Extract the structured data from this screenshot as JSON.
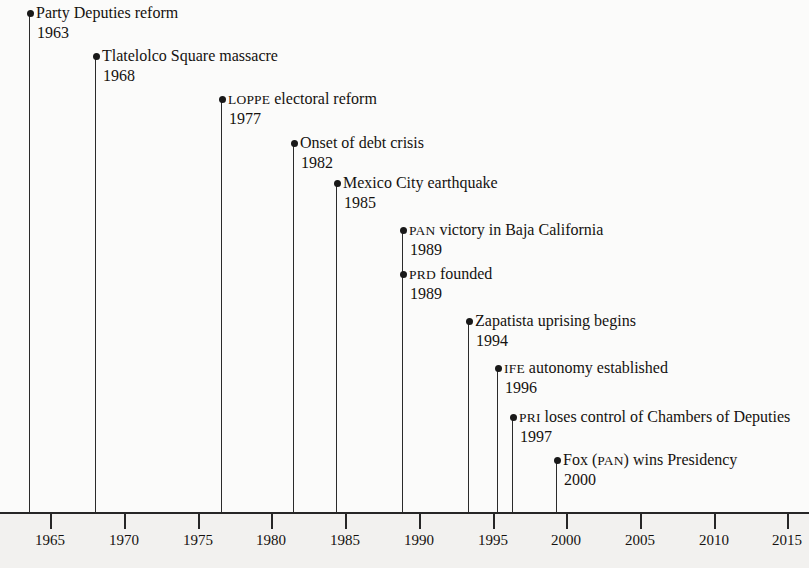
{
  "figure": {
    "background_color": "#fbfbfa",
    "axis_band_color": "#f2f1ef",
    "line_color": "#2b2b2b",
    "text_color": "#15120f"
  },
  "chart_data": {
    "type": "timeline",
    "title": "",
    "subtitle": "",
    "xlabel": "",
    "ylabel": "",
    "xlim": [
      1961.5,
      2017.5
    ],
    "grid": false,
    "legend": null,
    "axis": {
      "tick_values": [
        1965,
        1970,
        1975,
        1980,
        1985,
        1990,
        1995,
        2000,
        2005,
        2010,
        2015
      ],
      "tick_labels": [
        "1965",
        "1970",
        "1975",
        "1980",
        "1985",
        "1990",
        "1995",
        "2000",
        "2005",
        "2010",
        "2015"
      ],
      "tick_direction": "down",
      "tick_interval": 5
    },
    "events": [
      {
        "year": 1963,
        "year_label": "1963",
        "label": "Party Deputies reform",
        "smallcaps_prefix": "",
        "label_rest": "Party Deputies reform"
      },
      {
        "year": 1968,
        "year_label": "1968",
        "label": "Tlatelolco Square massacre",
        "smallcaps_prefix": "",
        "label_rest": "Tlatelolco Square massacre"
      },
      {
        "year": 1977,
        "year_label": "1977",
        "label": "LOPPE electoral reform",
        "smallcaps_prefix": "LOPPE",
        "label_rest": " electoral reform"
      },
      {
        "year": 1982,
        "year_label": "1982",
        "label": "Onset of debt crisis",
        "smallcaps_prefix": "",
        "label_rest": "Onset of debt crisis"
      },
      {
        "year": 1985,
        "year_label": "1985",
        "label": "Mexico City earthquake",
        "smallcaps_prefix": "",
        "label_rest": "Mexico City earthquake"
      },
      {
        "year": 1989,
        "year_label": "1989",
        "label": "PAN victory in Baja California",
        "smallcaps_prefix": "PAN",
        "label_rest": " victory in Baja California"
      },
      {
        "year": 1989,
        "year_label": "1989",
        "label": "PRD founded",
        "smallcaps_prefix": "PRD",
        "label_rest": " founded"
      },
      {
        "year": 1994,
        "year_label": "1994",
        "label": "Zapatista uprising begins",
        "smallcaps_prefix": "",
        "label_rest": "Zapatista uprising begins"
      },
      {
        "year": 1996,
        "year_label": "1996",
        "label": "IFE autonomy established",
        "smallcaps_prefix": "IFE",
        "label_rest": " autonomy established"
      },
      {
        "year": 1997,
        "year_label": "1997",
        "label": "PRI loses control of Chambers of Deputies",
        "smallcaps_prefix": "PRI",
        "label_rest": " loses control of Chambers of Deputies"
      },
      {
        "year": 2000,
        "year_label": "2000",
        "label": "Fox (PAN) wins Presidency",
        "smallcaps_prefix": "",
        "label_rest": "Fox (PAN) wins Presidency"
      }
    ]
  },
  "layout": {
    "events_px": [
      {
        "x": 29,
        "dot_y": 13
      },
      {
        "x": 95,
        "dot_y": 56
      },
      {
        "x": 221,
        "dot_y": 99
      },
      {
        "x": 293,
        "dot_y": 143
      },
      {
        "x": 336,
        "dot_y": 183
      },
      {
        "x": 402,
        "dot_y": 230
      },
      {
        "x": 402,
        "dot_y": 274
      },
      {
        "x": 468,
        "dot_y": 321
      },
      {
        "x": 497,
        "dot_y": 368
      },
      {
        "x": 512,
        "dot_y": 417
      },
      {
        "x": 556,
        "dot_y": 460
      }
    ],
    "axis_ticks_px": [
      50,
      124,
      198,
      271,
      345,
      419,
      493,
      566,
      640,
      714,
      787
    ],
    "axis_y": 512,
    "stem_bottom_y": 512
  }
}
